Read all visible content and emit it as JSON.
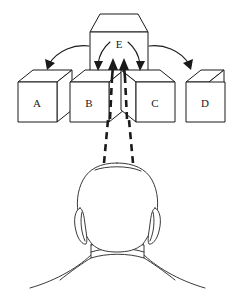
{
  "figure": {
    "background_color": "#ffffff",
    "line_color": "#1a1a1a",
    "body_line_color": "#3a3a3a"
  },
  "cubes": [
    {
      "id": "A",
      "label": "A",
      "label_x": 37,
      "label_y": 104,
      "perspective": "right-face"
    },
    {
      "id": "B",
      "label": "B",
      "label_x": 89,
      "label_y": 104,
      "perspective": "right-face"
    },
    {
      "id": "C",
      "label": "C",
      "label_x": 155,
      "label_y": 104,
      "perspective": "left-face"
    },
    {
      "id": "D",
      "label": "D",
      "label_x": 205,
      "label_y": 104,
      "perspective": "right-face"
    },
    {
      "id": "E",
      "label": "E",
      "label_x": 119,
      "label_y": 45,
      "perspective": "frontal-top"
    }
  ],
  "arrows": {
    "long_left": {
      "from": "E",
      "to": "A"
    },
    "long_right": {
      "from": "E",
      "to": "D"
    },
    "short_left": {
      "from": "E",
      "to": "B"
    },
    "short_right": {
      "from": "E",
      "to": "C"
    },
    "gaze_left": {
      "from": "head",
      "to": "E"
    },
    "gaze_right": {
      "from": "head",
      "to": "E"
    }
  },
  "person": {
    "view": "back-of-head",
    "parts": [
      "head",
      "left-ear",
      "right-ear",
      "neck",
      "collar",
      "shoulders"
    ]
  }
}
